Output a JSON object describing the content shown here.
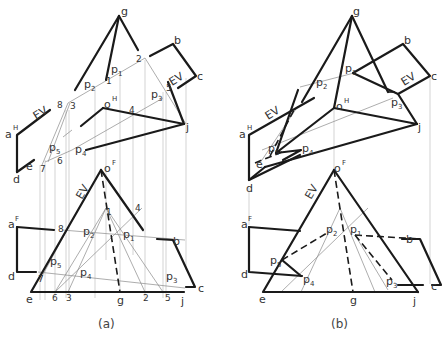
{
  "figure": {
    "panels": [
      {
        "caption": "(a)",
        "top_view": {
          "superscript_H": "H",
          "labels": {
            "g": "g",
            "b": "b",
            "c": "c",
            "j": "j",
            "a": "a",
            "o": "o",
            "e": "e",
            "d": "d",
            "EV1": "EV",
            "EV2": "EV",
            "p1": "p",
            "p1_sub": "1",
            "p2": "p",
            "p2_sub": "2",
            "p3": "p",
            "p3_sub": "3",
            "p4": "p",
            "p4_sub": "4",
            "p5": "p",
            "p5_sub": "5",
            "n1": "1",
            "n2": "2",
            "n3": "3",
            "n4": "4",
            "n5": "5",
            "n6": "6",
            "n7": "7",
            "n8": "8"
          }
        },
        "front_view": {
          "superscript_F": "F",
          "labels": {
            "o": "o",
            "a": "a",
            "b": "b",
            "c": "c",
            "d": "d",
            "e": "e",
            "g": "g",
            "j": "j",
            "EV": "EV",
            "p1": "p",
            "p1_sub": "1",
            "p2": "p",
            "p2_sub": "2",
            "p3": "p",
            "p3_sub": "3",
            "p4": "p",
            "p4_sub": "4",
            "p5": "p",
            "p5_sub": "5",
            "n1": "1",
            "n2": "2",
            "n3": "3",
            "n4": "4",
            "n5": "5",
            "n6": "6",
            "n7": "7",
            "n8": "8"
          }
        }
      },
      {
        "caption": "(b)",
        "top_view": {
          "superscript_H": "H",
          "labels": {
            "g": "g",
            "b": "b",
            "c": "c",
            "j": "j",
            "a": "a",
            "o": "o",
            "e": "e",
            "d": "d",
            "EV1": "EV",
            "EV2": "EV",
            "p1": "p",
            "p1_sub": "1",
            "p2": "p",
            "p2_sub": "2",
            "p3": "p",
            "p3_sub": "3",
            "p4": "p",
            "p4_sub": "4",
            "p5": "p",
            "p5_sub": "5"
          }
        },
        "front_view": {
          "superscript_F": "F",
          "labels": {
            "o": "o",
            "a": "a",
            "b": "b",
            "c": "c",
            "d": "d",
            "e": "e",
            "g": "g",
            "j": "j",
            "EV": "EV",
            "p1": "p",
            "p1_sub": "1",
            "p2": "p",
            "p2_sub": "2",
            "p3": "p",
            "p3_sub": "3",
            "p4": "p",
            "p4_sub": "4",
            "p5": "p",
            "p5_sub": "5"
          }
        }
      }
    ]
  }
}
